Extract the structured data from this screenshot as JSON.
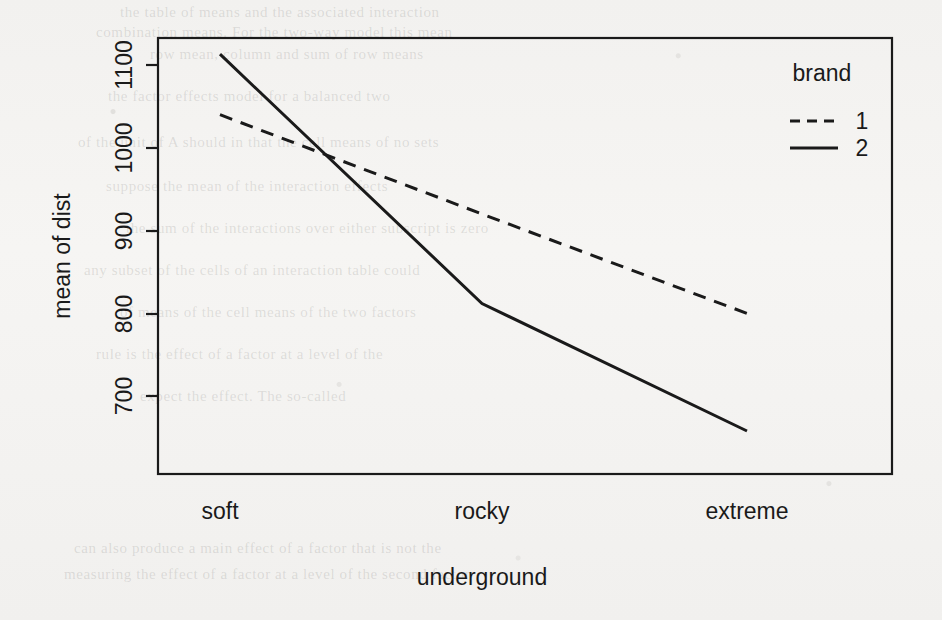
{
  "figure": {
    "kind": "interaction-plot",
    "background_color": "#f4f3f1",
    "ink_color": "#1a1a1a"
  },
  "chart_data": {
    "type": "line",
    "title": "",
    "xlabel": "underground",
    "ylabel": "mean of  dist",
    "categories": [
      "soft",
      "rocky",
      "extreme"
    ],
    "xticklabels": [
      "soft",
      "rocky",
      "extreme"
    ],
    "yticklabels": [
      "700",
      "800",
      "900",
      "1000",
      "1100"
    ],
    "yticks": [
      700,
      800,
      900,
      1000,
      1100
    ],
    "ylim": [
      650,
      1150
    ],
    "grid": false,
    "legend": {
      "title": "brand",
      "position": "top-right-inside",
      "entries": [
        {
          "label": "1",
          "linestyle": "dashed"
        },
        {
          "label": "2",
          "linestyle": "solid"
        }
      ]
    },
    "series": [
      {
        "name": "1",
        "linestyle": "dashed",
        "values": [
          1040,
          920,
          800
        ]
      },
      {
        "name": "2",
        "linestyle": "solid",
        "values": [
          1113,
          812,
          658
        ]
      }
    ]
  },
  "ghost_text": {
    "lines": [
      "the table of means and the associated interaction",
      "combination means. For the two-way model this mean",
      "row mean, column and sum of row means",
      "the factor effects model for a balanced two",
      "of the unit of A should in that the cell means  of no sets",
      "suppose the mean of the interaction effects",
      "the sum of the interactions over either subscript is zero",
      "any subset of the cells of an interaction table could",
      "of means of the cell means of the two factors",
      "rule is the effect of a factor at a level of the",
      "expect the effect. The so-called",
      "can also produce a main effect of a factor that is not the",
      "measuring the effect of a factor at a level of the second factor"
    ]
  }
}
